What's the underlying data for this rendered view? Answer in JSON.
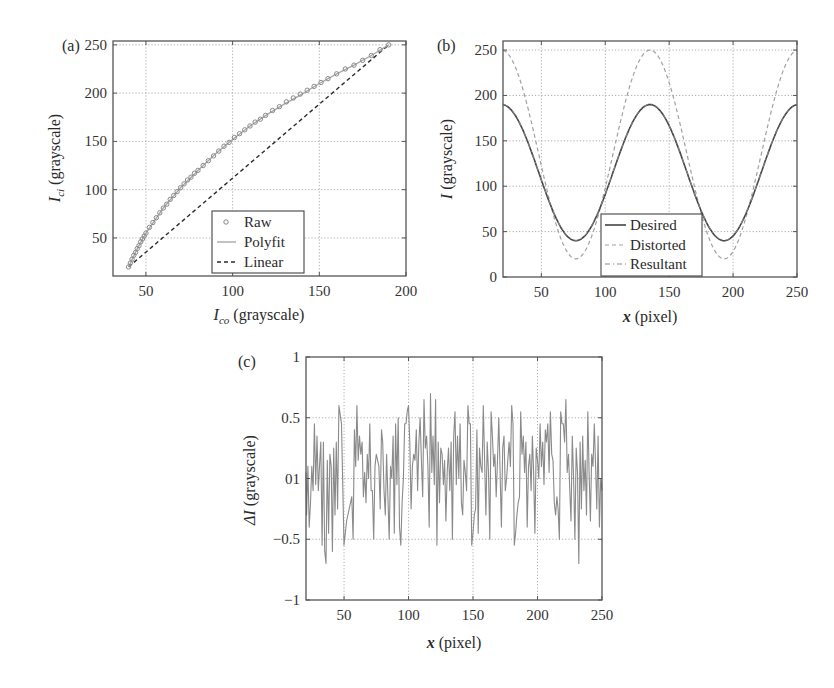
{
  "figure": {
    "panels": [
      {
        "label": "(a)"
      },
      {
        "label": "(b)"
      },
      {
        "label": "(c)"
      }
    ]
  },
  "colors": {
    "raw_marker": "#8a8a8a",
    "polyfit": "#a8a8a8",
    "linear": "#2b2b2b",
    "desired": "#444444",
    "distorted": "#a0a0a0",
    "resultant": "#8c8c8c",
    "delta": "#8a8a8a"
  },
  "chart_data": [
    {
      "id": "a",
      "type": "scatter",
      "panel_label": "(a)",
      "title": "",
      "xlabel_main": "I",
      "xlabel_sub": "co",
      "xlabel_rest": " (grayscale)",
      "ylabel_main": "I",
      "ylabel_sub": "ci",
      "ylabel_rest": " (grayscale)",
      "xlim": [
        31,
        200
      ],
      "ylim": [
        10.6,
        254
      ],
      "xticks": [
        50,
        100,
        150,
        200
      ],
      "yticks": [
        50,
        100,
        150,
        200,
        250
      ],
      "grid": true,
      "legend_position": "lower right",
      "legend": [
        "Raw",
        "Polyfit",
        "Linear"
      ],
      "series": [
        {
          "name": "Raw",
          "style": "circle-markers",
          "x": [
            40,
            41,
            42,
            43,
            44,
            45,
            46,
            47,
            48,
            49,
            50,
            52,
            54,
            56,
            58,
            60,
            62,
            64,
            66,
            68,
            70,
            72,
            74,
            76,
            78,
            80,
            83,
            86,
            89,
            92,
            95,
            98,
            101,
            104,
            107,
            110,
            113,
            116,
            119,
            123,
            127,
            131,
            135,
            139,
            143,
            147,
            151,
            155,
            160,
            165,
            170,
            175,
            180,
            185,
            190
          ],
          "y": [
            20,
            24,
            28,
            32,
            35,
            39,
            42,
            46,
            49,
            52,
            55,
            61,
            66,
            71,
            76,
            81,
            85,
            90,
            94,
            98,
            102,
            106,
            110,
            113,
            117,
            120,
            125,
            130,
            135,
            140,
            145,
            149,
            154,
            158,
            162,
            166,
            170,
            173,
            177,
            182,
            186,
            191,
            195,
            199,
            203,
            207,
            211,
            215,
            220,
            225,
            229,
            234,
            239,
            245,
            250
          ]
        },
        {
          "name": "Polyfit",
          "style": "solid",
          "x": [
            40,
            45,
            50,
            60,
            70,
            80,
            90,
            100,
            110,
            120,
            130,
            140,
            150,
            160,
            170,
            180,
            190
          ],
          "y": [
            20,
            39,
            55,
            81,
            102,
            120,
            137,
            152,
            166,
            178,
            189,
            199,
            210,
            220,
            229,
            239,
            250
          ]
        },
        {
          "name": "Linear",
          "style": "dashed",
          "x": [
            40,
            190
          ],
          "y": [
            20,
            250
          ]
        }
      ]
    },
    {
      "id": "b",
      "type": "line",
      "panel_label": "(b)",
      "title": "",
      "xlabel_main": "x",
      "xlabel_rest": " (pixel)",
      "ylabel_main": "I",
      "ylabel_rest": " (grayscale)",
      "xlim": [
        20,
        250
      ],
      "ylim": [
        0,
        260
      ],
      "xticks": [
        50,
        100,
        150,
        200,
        250
      ],
      "yticks": [
        0,
        50,
        100,
        150,
        200,
        250
      ],
      "grid": true,
      "legend_position": "lower center",
      "legend": [
        "Desired",
        "Distorted",
        "Resultant"
      ],
      "series": [
        {
          "name": "Desired",
          "style": "solid",
          "model": "115 + 75*cos(2*pi*(x-135)/116)",
          "x": [
            20,
            30,
            40,
            50,
            60,
            70,
            78,
            90,
            100,
            110,
            120,
            135,
            150,
            160,
            170,
            180,
            194,
            205,
            215,
            225,
            235,
            245,
            250
          ],
          "y": [
            190,
            183,
            162,
            131,
            96,
            61,
            40,
            58,
            85,
            122,
            160,
            190,
            165,
            135,
            98,
            65,
            40,
            56,
            90,
            127,
            160,
            183,
            190
          ]
        },
        {
          "name": "Distorted",
          "style": "dashed",
          "model": "gamma-distorted desired, peak 250, trough 20",
          "x": [
            20,
            30,
            40,
            50,
            60,
            70,
            78,
            90,
            100,
            110,
            120,
            135,
            150,
            160,
            170,
            180,
            194,
            205,
            215,
            225,
            235,
            245,
            250
          ],
          "y": [
            250,
            243,
            216,
            168,
            114,
            56,
            20,
            50,
            98,
            158,
            212,
            250,
            222,
            182,
            126,
            68,
            20,
            44,
            100,
            160,
            212,
            242,
            250
          ]
        },
        {
          "name": "Resultant",
          "style": "dash-dot",
          "note": "overlaps Desired",
          "x": [
            20,
            30,
            40,
            50,
            60,
            70,
            78,
            90,
            100,
            110,
            120,
            135,
            150,
            160,
            170,
            180,
            194,
            205,
            215,
            225,
            235,
            245,
            250
          ],
          "y": [
            190,
            183,
            162,
            131,
            96,
            61,
            40,
            58,
            85,
            122,
            160,
            190,
            165,
            135,
            98,
            65,
            40,
            56,
            90,
            127,
            160,
            183,
            190
          ]
        }
      ]
    },
    {
      "id": "c",
      "type": "line",
      "panel_label": "(c)",
      "title": "",
      "xlabel_main": "x",
      "xlabel_rest": " (pixel)",
      "ylabel_main": "ΔI",
      "ylabel_rest": " (grayscale)",
      "xlim": [
        20.5,
        250
      ],
      "ylim": [
        -1,
        1
      ],
      "xticks": [
        50,
        100,
        150,
        200,
        250
      ],
      "yticks": [
        -1,
        -0.5,
        0,
        0.5,
        1
      ],
      "ytick_labels": [
        "−1",
        "−0.5",
        "01",
        "0.5",
        "1"
      ],
      "grid": true,
      "series": [
        {
          "name": "ΔI",
          "style": "solid",
          "x": [
            20.5,
            21,
            22,
            23,
            24,
            25,
            26,
            27,
            28,
            29,
            30,
            31,
            32,
            33,
            34,
            35,
            36,
            37,
            38,
            39,
            40,
            41,
            42,
            43,
            44,
            45,
            46,
            48,
            50,
            52,
            54,
            56,
            57,
            58,
            59,
            60,
            61,
            62,
            63,
            64,
            65,
            66,
            67,
            68,
            69,
            70,
            71,
            72,
            73,
            74,
            75,
            76,
            77,
            78,
            79,
            80,
            81,
            82,
            83,
            84,
            85,
            86,
            87,
            88,
            89,
            90,
            91,
            92,
            93,
            94,
            95,
            96,
            97,
            98,
            99,
            100,
            101,
            102,
            103,
            104,
            105,
            106,
            107,
            108,
            109,
            110,
            111,
            112,
            113,
            114,
            115,
            116,
            117,
            118,
            119,
            120,
            121,
            122,
            123,
            124,
            125,
            126,
            127,
            128,
            129,
            130,
            131,
            132,
            133,
            134,
            135,
            136,
            137,
            138,
            139,
            140,
            141,
            142,
            143,
            144,
            145,
            146,
            147,
            148,
            149,
            150,
            151,
            152,
            153,
            154,
            155,
            156,
            157,
            158,
            159,
            160,
            161,
            162,
            163,
            164,
            165,
            166,
            167,
            168,
            169,
            170,
            171,
            172,
            173,
            174,
            175,
            176,
            177,
            178,
            179,
            180,
            181,
            182,
            183,
            184,
            185,
            186,
            187,
            188,
            189,
            190,
            191,
            192,
            193,
            194,
            195,
            196,
            197,
            198,
            199,
            200,
            201,
            202,
            203,
            204,
            205,
            206,
            207,
            208,
            209,
            210,
            211,
            212,
            213,
            214,
            215,
            216,
            217,
            218,
            219,
            220,
            221,
            222,
            223,
            224,
            225,
            226,
            227,
            228,
            229,
            230,
            231,
            232,
            233,
            234,
            235,
            236,
            237,
            238,
            239,
            240,
            241,
            242,
            243,
            244,
            245,
            246,
            247,
            248,
            249,
            250
          ],
          "y": [
            0.05,
            -0.3,
            0.1,
            -0.4,
            -0.2,
            0.1,
            -0.1,
            0.45,
            -0.05,
            0.35,
            -0.1,
            0.1,
            0.3,
            -0.55,
            0.3,
            -0.6,
            -0.7,
            0.15,
            -0.45,
            0.2,
            0.1,
            -0.6,
            0.25,
            -0.3,
            0.3,
            -0.25,
            0.6,
            0.45,
            -0.55,
            -0.35,
            -0.25,
            -0.15,
            -0.5,
            0.4,
            0.1,
            0.6,
            0.15,
            0.35,
            0.2,
            0.3,
            -0.15,
            0.05,
            -0.2,
            0.2,
            0.0,
            0.45,
            -0.1,
            -0.1,
            -0.5,
            0.1,
            0.2,
            0.15,
            0.1,
            -0.25,
            0.4,
            0.3,
            -0.1,
            -0.3,
            0.2,
            -0.15,
            -0.5,
            0.1,
            0.0,
            0.35,
            -0.45,
            0.45,
            -0.05,
            0.5,
            -0.4,
            -0.55,
            -0.2,
            0.0,
            0.45,
            0.45,
            0.55,
            0.6,
            0.3,
            -0.25,
            0.1,
            0.2,
            0.15,
            0.4,
            -0.1,
            0.3,
            0.5,
            0.15,
            -0.15,
            0.65,
            0.25,
            0.35,
            0.1,
            -0.4,
            0.7,
            0.05,
            0.35,
            -0.05,
            0.65,
            -0.55,
            0.3,
            -0.2,
            0.25,
            0.2,
            -0.05,
            0.15,
            -0.35,
            0.05,
            0.25,
            -0.1,
            0.3,
            -0.5,
            0.35,
            0.55,
            -0.05,
            0.35,
            0.0,
            0.45,
            -0.2,
            -0.3,
            0.15,
            0.05,
            -0.1,
            0.6,
            0.45,
            0.45,
            -0.55,
            -0.45,
            -0.3,
            -0.25,
            0.4,
            -0.45,
            0.25,
            0.1,
            0.05,
            0.6,
            0.15,
            -0.3,
            0.3,
            0.05,
            -0.5,
            0.55,
            0.35,
            0.1,
            0.2,
            -0.15,
            0.15,
            0.5,
            0.05,
            -0.4,
            0.25,
            0.35,
            -0.1,
            0.0,
            0.15,
            0.3,
            0.1,
            0.6,
            0.45,
            -0.55,
            -0.45,
            -0.3,
            -0.2,
            -0.15,
            0.55,
            0.2,
            0.35,
            0.05,
            0.3,
            -0.4,
            0.1,
            0.2,
            -0.1,
            0.35,
            0.05,
            -0.45,
            0.25,
            0.15,
            0.0,
            0.45,
            0.1,
            0.3,
            -0.05,
            0.4,
            0.3,
            0.45,
            0.05,
            0.55,
            0.2,
            0.15,
            -0.2,
            -0.3,
            -0.15,
            -0.25,
            -0.5,
            0.55,
            0.45,
            0.45,
            0.3,
            0.65,
            0.05,
            0.2,
            -0.1,
            -0.35,
            0.35,
            0.0,
            -0.5,
            0.25,
            0.05,
            -0.7,
            0.3,
            -0.25,
            0.35,
            -0.1,
            0.15,
            -0.3,
            0.55,
            0.05,
            -0.35,
            0.2,
            0.1,
            0.45,
            0.1,
            -0.25,
            0.35,
            -0.4,
            0.0,
            -0.1,
            0.3,
            -0.25,
            0.05,
            -0.35,
            0.0
          ]
        }
      ]
    }
  ]
}
